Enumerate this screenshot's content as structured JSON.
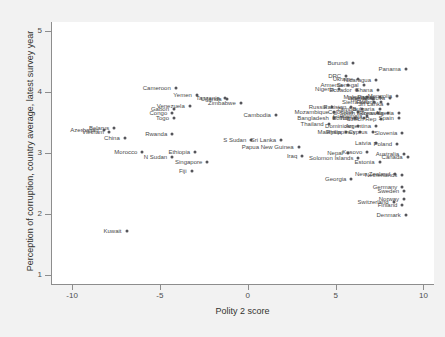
{
  "chart": {
    "type": "scatter",
    "xlabel": "Polity 2 score",
    "ylabel": "Perception of corruption, country average, latest survey year"
  },
  "axes": {
    "x_ticks": [
      "-10",
      "-5",
      "0",
      "5",
      "10"
    ],
    "x_values": [
      -10,
      -5,
      0,
      5,
      10
    ],
    "y_ticks": [
      "1",
      "2",
      "3",
      "4",
      "5"
    ],
    "y_values": [
      1,
      2,
      3,
      4,
      5
    ],
    "xlim": [
      -11.2,
      10.6
    ],
    "ylim": [
      0.85,
      5.15
    ]
  },
  "chart_data": {
    "type": "scatter",
    "title": "",
    "xlabel": "Polity 2 score",
    "ylabel": "Perception of corruption, country average, latest survey year",
    "xlim": [
      -11.2,
      10.6
    ],
    "ylim": [
      0.85,
      5.15
    ],
    "xticks": [
      -10,
      -5,
      0,
      5,
      10
    ],
    "yticks": [
      1,
      2,
      3,
      4,
      5
    ],
    "grid": false,
    "legend": "none",
    "point_label_position": "left",
    "points": [
      {
        "label": "Burundi",
        "x": 6.0,
        "y": 4.48
      },
      {
        "label": "Panama",
        "x": 9.0,
        "y": 4.38
      },
      {
        "label": "DRC",
        "x": 5.6,
        "y": 4.26
      },
      {
        "label": "Ukraine",
        "x": 6.3,
        "y": 4.21
      },
      {
        "label": "Nicaragua",
        "x": 7.3,
        "y": 4.19
      },
      {
        "label": "Armenia",
        "x": 5.7,
        "y": 4.12
      },
      {
        "label": "Senegal",
        "x": 6.6,
        "y": 4.11
      },
      {
        "label": "Nigeria",
        "x": 5.2,
        "y": 4.05
      },
      {
        "label": "Ecuador",
        "x": 6.2,
        "y": 4.04
      },
      {
        "label": "Ghana",
        "x": 7.4,
        "y": 4.03
      },
      {
        "label": "Cameroon",
        "x": -4.1,
        "y": 4.06
      },
      {
        "label": "Malawi",
        "x": 6.8,
        "y": 3.92
      },
      {
        "label": "Papua",
        "x": 7.5,
        "y": 3.92
      },
      {
        "label": "Mongolia",
        "x": 8.5,
        "y": 3.93
      },
      {
        "label": "Moldova",
        "x": 8.1,
        "y": 3.9
      },
      {
        "label": "Kenya",
        "x": 7.1,
        "y": 3.88
      },
      {
        "label": "Liberia",
        "x": 7.0,
        "y": 3.9
      },
      {
        "label": "Yemen",
        "x": -2.9,
        "y": 3.95
      },
      {
        "label": "Tanzania",
        "x": -1.3,
        "y": 3.9
      },
      {
        "label": "Uganda",
        "x": -1.2,
        "y": 3.88
      },
      {
        "label": "Zimbabwe",
        "x": -0.4,
        "y": 3.82
      },
      {
        "label": "Sierra Leone",
        "x": 7.6,
        "y": 3.83
      },
      {
        "label": "Peru",
        "x": 7.2,
        "y": 3.84
      },
      {
        "label": "Sri Lanka",
        "x": 8.0,
        "y": 3.81
      },
      {
        "label": "Russia",
        "x": 4.8,
        "y": 3.76
      },
      {
        "label": "Pakistan",
        "x": 5.9,
        "y": 3.75
      },
      {
        "label": "Zambia",
        "x": 6.5,
        "y": 3.72
      },
      {
        "label": "Bulgaria",
        "x": 7.5,
        "y": 3.73
      },
      {
        "label": "Venezuela",
        "x": -3.3,
        "y": 3.77
      },
      {
        "label": "Gabon",
        "x": -4.2,
        "y": 3.73
      },
      {
        "label": "Mozambique",
        "x": 4.9,
        "y": 3.68
      },
      {
        "label": "Colombia",
        "x": 6.3,
        "y": 3.67
      },
      {
        "label": "South Korea",
        "x": 7.4,
        "y": 3.66
      },
      {
        "label": "Romania",
        "x": 8.0,
        "y": 3.66
      },
      {
        "label": "Algeria",
        "x": 8.6,
        "y": 3.65
      },
      {
        "label": "Congo",
        "x": -4.3,
        "y": 3.66
      },
      {
        "label": "Cambodia",
        "x": 1.6,
        "y": 3.63
      },
      {
        "label": "Bangladesh",
        "x": 4.9,
        "y": 3.58
      },
      {
        "label": "Bolivia",
        "x": 6.1,
        "y": 3.57
      },
      {
        "label": "Tunisia",
        "x": 6.6,
        "y": 3.57
      },
      {
        "label": "Czech Rep",
        "x": 7.6,
        "y": 3.56
      },
      {
        "label": "Guatemala",
        "x": 6.8,
        "y": 3.6
      },
      {
        "label": "Spain",
        "x": 8.6,
        "y": 3.57
      },
      {
        "label": "Togo",
        "x": -4.2,
        "y": 3.58
      },
      {
        "label": "Thailand",
        "x": 4.6,
        "y": 3.48
      },
      {
        "label": "Dominican",
        "x": 6.3,
        "y": 3.44
      },
      {
        "label": "Argentina",
        "x": 7.3,
        "y": 3.45
      },
      {
        "label": "Belarus",
        "x": -7.6,
        "y": 3.41
      },
      {
        "label": "Azerbaijan",
        "x": -8.2,
        "y": 3.38
      },
      {
        "label": "Vietnam",
        "x": -7.9,
        "y": 3.34
      },
      {
        "label": "Malaysia",
        "x": 5.6,
        "y": 3.35
      },
      {
        "label": "Philippines",
        "x": 6.4,
        "y": 3.34
      },
      {
        "label": "Cyprus",
        "x": 7.1,
        "y": 3.34
      },
      {
        "label": "Slovenia",
        "x": 8.8,
        "y": 3.33
      },
      {
        "label": "Rwanda",
        "x": -4.3,
        "y": 3.31
      },
      {
        "label": "China",
        "x": -7.0,
        "y": 3.25
      },
      {
        "label": "S Sudan",
        "x": 0.2,
        "y": 3.21
      },
      {
        "label": "Sri Lanka ",
        "x": 1.9,
        "y": 3.22
      },
      {
        "label": "Latvia",
        "x": 7.3,
        "y": 3.16
      },
      {
        "label": "Poland",
        "x": 8.5,
        "y": 3.15
      },
      {
        "label": "Papua New Guinea",
        "x": 2.9,
        "y": 3.1
      },
      {
        "label": "Morocco",
        "x": -6.0,
        "y": 3.02
      },
      {
        "label": "Nepal",
        "x": 5.7,
        "y": 3.0
      },
      {
        "label": "Kosovo",
        "x": 6.8,
        "y": 3.01
      },
      {
        "label": "Australia",
        "x": 8.9,
        "y": 2.99
      },
      {
        "label": "Ethiopia",
        "x": -3.0,
        "y": 3.01
      },
      {
        "label": "Iraq",
        "x": 3.1,
        "y": 2.95
      },
      {
        "label": "Solomon Islands",
        "x": 6.3,
        "y": 2.92
      },
      {
        "label": "Canada",
        "x": 9.1,
        "y": 2.93
      },
      {
        "label": "N Sudan",
        "x": -4.3,
        "y": 2.94
      },
      {
        "label": "Singapore",
        "x": -2.3,
        "y": 2.85
      },
      {
        "label": "Estonia",
        "x": 7.5,
        "y": 2.85
      },
      {
        "label": "Fiji",
        "x": -3.2,
        "y": 2.7
      },
      {
        "label": "New Zealand",
        "x": 8.4,
        "y": 2.65
      },
      {
        "label": "Netherlands",
        "x": 8.8,
        "y": 2.64
      },
      {
        "label": "Georgia",
        "x": 5.9,
        "y": 2.58
      },
      {
        "label": "Germany",
        "x": 8.8,
        "y": 2.44
      },
      {
        "label": "Sweden",
        "x": 8.9,
        "y": 2.38
      },
      {
        "label": "Norway",
        "x": 8.9,
        "y": 2.24
      },
      {
        "label": "Switzerland",
        "x": 8.3,
        "y": 2.2
      },
      {
        "label": "Finland",
        "x": 8.8,
        "y": 2.15
      },
      {
        "label": "Denmark",
        "x": 9.0,
        "y": 1.99
      },
      {
        "label": "Kuwait",
        "x": -6.9,
        "y": 1.72
      }
    ]
  },
  "style": {
    "figure_bg": "#f2f2f2",
    "plot_bg": "#ffffff",
    "marker_color": "#55555a",
    "label_color": "#4a4a4a",
    "axis_color": "#8d8d8d"
  }
}
